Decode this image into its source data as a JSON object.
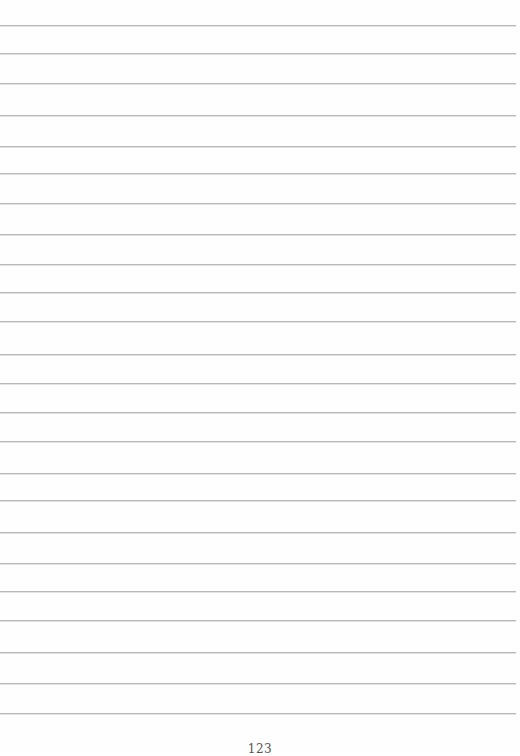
{
  "page": {
    "type": "lined notebook page",
    "background_color": "#fefefe",
    "rule_color": "#b9b9b9",
    "rule_y_positions": [
      25,
      53,
      83,
      115,
      146,
      173,
      203,
      234,
      264,
      292,
      321,
      354,
      383,
      412,
      441,
      473,
      500,
      532,
      563,
      591,
      620,
      652,
      683,
      713
    ],
    "page_number": "123"
  }
}
